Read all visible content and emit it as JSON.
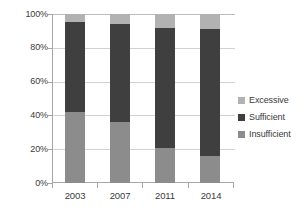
{
  "chart_data": {
    "type": "bar",
    "subtype": "stacked-100-percent",
    "title": "",
    "xlabel": "",
    "ylabel": "",
    "categories": [
      "2003",
      "2007",
      "2011",
      "2014"
    ],
    "ylim": [
      0,
      100
    ],
    "y_ticks": [
      "0%",
      "20%",
      "40%",
      "60%",
      "80%",
      "100%"
    ],
    "y_tick_values": [
      0,
      20,
      40,
      60,
      80,
      100
    ],
    "grid": true,
    "grid_axis": "y",
    "legend_position": "right",
    "stack_order_bottom_to_top": [
      "Insufficient",
      "Sufficient",
      "Excessive"
    ],
    "series": [
      {
        "name": "Insufficient",
        "color": "#8c8c8c",
        "values": [
          42,
          36,
          21,
          16
        ]
      },
      {
        "name": "Sufficient",
        "color": "#3f3f3f",
        "values": [
          53,
          58,
          71,
          75
        ]
      },
      {
        "name": "Excessive",
        "color": "#b2b2b2",
        "values": [
          5,
          6,
          8,
          9
        ]
      }
    ]
  },
  "axes": {
    "y_tick_labels": [
      "100%",
      "80%",
      "60%",
      "40%",
      "20%",
      "0%"
    ],
    "x_tick_labels": [
      "2003",
      "2007",
      "2011",
      "2014"
    ]
  },
  "legend": {
    "items": [
      {
        "label": "Excessive",
        "color": "#b2b2b2"
      },
      {
        "label": "Sufficient",
        "color": "#3f3f3f"
      },
      {
        "label": "Insufficient",
        "color": "#8c8c8c"
      }
    ]
  },
  "colors": {
    "axis_line": "#a6a6a6",
    "gridline": "#d2d2d2",
    "text": "#3b3b3b",
    "background": "#ffffff"
  }
}
